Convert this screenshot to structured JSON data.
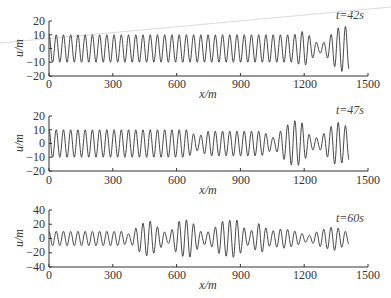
{
  "chart_data": [
    {
      "type": "line",
      "title": "",
      "annotation": "t=42s",
      "xlabel": "x/m",
      "ylabel": "u/m",
      "xlim": [
        0,
        1500
      ],
      "ylim": [
        -20,
        20
      ],
      "xticks": [
        0,
        300,
        600,
        900,
        1200,
        1500
      ],
      "yticks": [
        20,
        10,
        0,
        -10,
        -20
      ],
      "grid": false,
      "series": [
        {
          "name": "u(x) at t=42s",
          "wavelength_m": 34,
          "x_range": [
            0,
            1410
          ],
          "envelope": [
            {
              "x": 0,
              "amp": 10
            },
            {
              "x": 1150,
              "amp": 10
            },
            {
              "x": 1200,
              "amp": 13
            },
            {
              "x": 1240,
              "amp": 7
            },
            {
              "x": 1270,
              "amp": 3
            },
            {
              "x": 1300,
              "amp": 5
            },
            {
              "x": 1340,
              "amp": 13
            },
            {
              "x": 1380,
              "amp": 17
            },
            {
              "x": 1410,
              "amp": 15
            }
          ]
        }
      ]
    },
    {
      "type": "line",
      "title": "",
      "annotation": "t=47s",
      "xlabel": "x/m",
      "ylabel": "u/m",
      "xlim": [
        0,
        1500
      ],
      "ylim": [
        -20,
        20
      ],
      "xticks": [
        0,
        300,
        600,
        900,
        1200,
        1500
      ],
      "yticks": [
        20,
        10,
        0,
        -10,
        -20
      ],
      "grid": false,
      "series": [
        {
          "name": "u(x) at t=47s",
          "wavelength_m": 34,
          "x_range": [
            0,
            1410
          ],
          "envelope": [
            {
              "x": 0,
              "amp": 10
            },
            {
              "x": 650,
              "amp": 10
            },
            {
              "x": 700,
              "amp": 5
            },
            {
              "x": 750,
              "amp": 9
            },
            {
              "x": 1000,
              "amp": 9
            },
            {
              "x": 1060,
              "amp": 4
            },
            {
              "x": 1100,
              "amp": 11
            },
            {
              "x": 1150,
              "amp": 17
            },
            {
              "x": 1190,
              "amp": 15
            },
            {
              "x": 1230,
              "amp": 5
            },
            {
              "x": 1270,
              "amp": 4
            },
            {
              "x": 1310,
              "amp": 10
            },
            {
              "x": 1350,
              "amp": 16
            },
            {
              "x": 1410,
              "amp": 12
            }
          ]
        }
      ]
    },
    {
      "type": "line",
      "title": "",
      "annotation": "t=60s",
      "xlabel": "x/m",
      "ylabel": "u/m",
      "xlim": [
        0,
        1500
      ],
      "ylim": [
        -40,
        40
      ],
      "xticks": [
        0,
        300,
        600,
        900,
        1200,
        1500
      ],
      "yticks": [
        40,
        20,
        0,
        -20,
        -40
      ],
      "grid": false,
      "series": [
        {
          "name": "u(x) at t=60s",
          "wavelength_m": 34,
          "x_range": [
            0,
            1410
          ],
          "envelope": [
            {
              "x": 0,
              "amp": 10
            },
            {
              "x": 340,
              "amp": 10
            },
            {
              "x": 380,
              "amp": 6
            },
            {
              "x": 420,
              "amp": 18
            },
            {
              "x": 470,
              "amp": 26
            },
            {
              "x": 520,
              "amp": 14
            },
            {
              "x": 560,
              "amp": 6
            },
            {
              "x": 610,
              "amp": 24
            },
            {
              "x": 660,
              "amp": 27
            },
            {
              "x": 720,
              "amp": 8
            },
            {
              "x": 760,
              "amp": 10
            },
            {
              "x": 810,
              "amp": 24
            },
            {
              "x": 880,
              "amp": 27
            },
            {
              "x": 940,
              "amp": 8
            },
            {
              "x": 990,
              "amp": 22
            },
            {
              "x": 1040,
              "amp": 10
            },
            {
              "x": 1100,
              "amp": 14
            },
            {
              "x": 1150,
              "amp": 11
            },
            {
              "x": 1220,
              "amp": 4
            },
            {
              "x": 1280,
              "amp": 12
            },
            {
              "x": 1340,
              "amp": 17
            },
            {
              "x": 1380,
              "amp": 12
            },
            {
              "x": 1410,
              "amp": 8
            }
          ]
        }
      ]
    }
  ],
  "panels": [
    {
      "time_label": "t=42s",
      "xlabel": "x/m",
      "ylabel": "u/m",
      "xticks": [
        "0",
        "300",
        "600",
        "900",
        "1200",
        "1500"
      ],
      "yticks": [
        "20",
        "10",
        "0",
        "−10",
        "−20"
      ]
    },
    {
      "time_label": "t=47s",
      "xlabel": "x/m",
      "ylabel": "u/m",
      "xticks": [
        "0",
        "300",
        "600",
        "900",
        "1200",
        "1500"
      ],
      "yticks": [
        "20",
        "10",
        "0",
        "−10",
        "−20"
      ]
    },
    {
      "time_label": "t=60s",
      "xlabel": "x/m",
      "ylabel": "u/m",
      "xticks": [
        "0",
        "300",
        "600",
        "900",
        "1200",
        "1500"
      ],
      "yticks": [
        "40",
        "20",
        "0",
        "−20",
        "−40"
      ]
    }
  ],
  "colors": {
    "line": "#333333",
    "axis": "#333333",
    "background": "#ffffff",
    "scan_artifact_line": "#cccccc"
  }
}
